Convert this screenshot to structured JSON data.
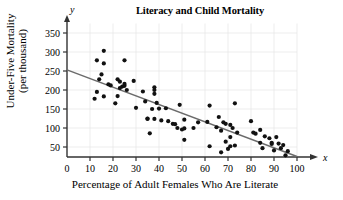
{
  "chart_data": {
    "type": "scatter",
    "title": "Literacy and Child Mortality",
    "xlabel": "Percentage of Adult Females Who Are Literate",
    "ylabel": "Under-Five Mortality (per thousand)",
    "ylabel_line1": "Under-Five Mortality",
    "ylabel_line2": "(per thousand)",
    "x_axis_symbol": "x",
    "y_axis_symbol": "y",
    "xlim": [
      0,
      100
    ],
    "ylim": [
      0,
      375
    ],
    "xticks": [
      0,
      10,
      20,
      30,
      40,
      50,
      60,
      70,
      80,
      90,
      100
    ],
    "yticks": [
      50,
      100,
      150,
      200,
      250,
      300,
      350
    ],
    "xtick_labels": [
      "0",
      "10",
      "20",
      "30",
      "40",
      "50",
      "60",
      "70",
      "80",
      "90",
      "100"
    ],
    "ytick_labels": [
      "50",
      "100",
      "150",
      "200",
      "250",
      "300",
      "350"
    ],
    "grid": true,
    "legend": "none",
    "point_color": "#111111",
    "line_color": "#6b6b6b",
    "grid_color": "#e8e8e8",
    "axis_color": "#333333",
    "series": [
      {
        "name": "Countries",
        "points": [
          [
            12,
            177
          ],
          [
            13,
            278
          ],
          [
            13,
            195
          ],
          [
            14,
            228
          ],
          [
            15,
            241
          ],
          [
            16,
            303
          ],
          [
            16,
            270
          ],
          [
            16,
            183
          ],
          [
            18,
            215
          ],
          [
            19,
            212
          ],
          [
            21,
            165
          ],
          [
            22,
            184
          ],
          [
            22,
            228
          ],
          [
            23,
            222
          ],
          [
            23,
            205
          ],
          [
            24,
            209
          ],
          [
            25,
            278
          ],
          [
            25,
            216
          ],
          [
            25,
            211
          ],
          [
            26,
            200
          ],
          [
            29,
            224
          ],
          [
            30,
            153
          ],
          [
            33,
            196
          ],
          [
            34,
            170
          ],
          [
            35,
            125
          ],
          [
            35,
            124
          ],
          [
            36,
            86
          ],
          [
            37,
            150
          ],
          [
            38,
            207
          ],
          [
            38,
            200
          ],
          [
            38,
            190
          ],
          [
            38,
            124
          ],
          [
            39,
            166
          ],
          [
            40,
            151
          ],
          [
            41,
            120
          ],
          [
            43,
            152
          ],
          [
            44,
            118
          ],
          [
            46,
            111
          ],
          [
            47,
            110
          ],
          [
            48,
            100
          ],
          [
            49,
            161
          ],
          [
            50,
            96
          ],
          [
            51,
            122
          ],
          [
            51,
            99
          ],
          [
            51,
            69
          ],
          [
            55,
            100
          ],
          [
            57,
            115
          ],
          [
            61,
            116
          ],
          [
            62,
            159
          ],
          [
            62,
            52
          ],
          [
            65,
            102
          ],
          [
            66,
            129
          ],
          [
            67,
            93
          ],
          [
            67,
            36
          ],
          [
            68,
            115
          ],
          [
            69,
            111
          ],
          [
            69,
            64
          ],
          [
            70,
            45
          ],
          [
            71,
            108
          ],
          [
            71,
            76
          ],
          [
            71,
            52
          ],
          [
            72,
            100
          ],
          [
            73,
            165
          ],
          [
            73,
            54
          ],
          [
            74,
            88
          ],
          [
            80,
            118
          ],
          [
            81,
            88
          ],
          [
            82,
            85
          ],
          [
            84,
            95
          ],
          [
            84,
            61
          ],
          [
            85,
            47
          ],
          [
            86,
            78
          ],
          [
            88,
            73
          ],
          [
            89,
            58
          ],
          [
            89,
            61
          ],
          [
            90,
            41
          ],
          [
            91,
            76
          ],
          [
            92,
            59
          ],
          [
            93,
            47
          ],
          [
            94,
            55
          ],
          [
            95,
            28
          ],
          [
            96,
            39
          ]
        ]
      }
    ],
    "trendline": {
      "name": "Least-squares regression line",
      "x_start": 0,
      "y_start": 253,
      "x_end": 100,
      "y_end": 25
    }
  }
}
